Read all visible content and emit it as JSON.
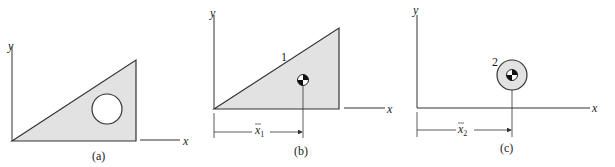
{
  "figure": {
    "panels": [
      {
        "caption": "(a)",
        "x_label": "x",
        "y_label": "y",
        "description": "triangular plate with circular hole"
      },
      {
        "caption": "(b)",
        "x_label": "x",
        "y_label": "y",
        "part_label": "1",
        "dimension_label": "x",
        "dimension_subscript": "1",
        "description": "triangle part 1 with centroid"
      },
      {
        "caption": "(c)",
        "x_label": "x",
        "y_label": "y",
        "part_label": "2",
        "dimension_label": "x",
        "dimension_subscript": "2",
        "description": "circular part 2 with centroid"
      }
    ],
    "colors": {
      "fill": "#e2e2e2",
      "stroke": "#333333"
    }
  }
}
